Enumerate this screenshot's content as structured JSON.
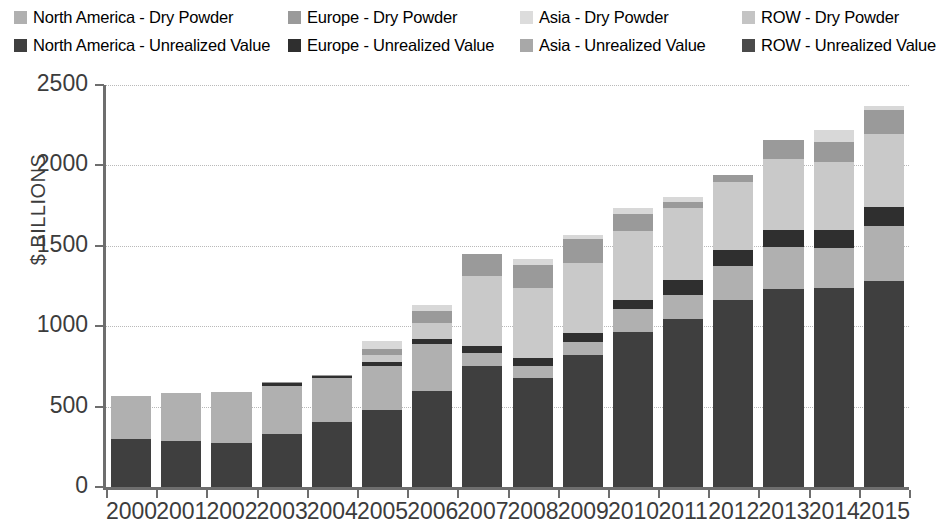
{
  "legend": {
    "rows": [
      [
        {
          "label": "North America - Dry Powder",
          "color": "#b0b0b0",
          "key": "na_dp"
        },
        {
          "label": "Europe - Dry Powder",
          "color": "#9a9a9a",
          "key": "eu_dp"
        },
        {
          "label": "Asia - Dry Powder",
          "color": "#dcdcdc",
          "key": "as_dp"
        },
        {
          "label": "ROW - Dry Powder",
          "color": "#c4c4c4",
          "key": "row_dp"
        }
      ],
      [
        {
          "label": "North America - Unrealized Value",
          "color": "#3f3f3f",
          "key": "na_uv"
        },
        {
          "label": "Europe - Unrealized Value",
          "color": "#2f2f2f",
          "key": "eu_uv"
        },
        {
          "label": "Asia - Unrealized Value",
          "color": "#a8a8a8",
          "key": "as_uv"
        },
        {
          "label": "ROW - Unrealized Value",
          "color": "#4a4a4a",
          "key": "row_uv"
        }
      ]
    ]
  },
  "chart_data": {
    "type": "bar",
    "stacked": true,
    "title": "",
    "xlabel": "",
    "ylabel": "$ BILLIONS",
    "ylim": [
      0,
      2500
    ],
    "yticks": [
      0,
      500,
      1000,
      1500,
      2000,
      2500
    ],
    "grid": true,
    "legend_position": "top",
    "categories": [
      "2000",
      "2001",
      "2002",
      "2003",
      "2004",
      "2005",
      "2006",
      "2007",
      "2008",
      "2009",
      "2010",
      "2011",
      "2012",
      "2013",
      "2014",
      "2015"
    ],
    "series": [
      {
        "name": "North America - Unrealized Value",
        "color": "#3f3f3f",
        "values": [
          300,
          285,
          272,
          330,
          405,
          480,
          600,
          755,
          675,
          820,
          965,
          1045,
          1160,
          1230,
          1235,
          1280
        ]
      },
      {
        "name": "North America - Dry Powder",
        "color": "#b0b0b0",
        "values": [
          265,
          300,
          320,
          300,
          270,
          275,
          290,
          80,
          75,
          80,
          140,
          150,
          215,
          265,
          250,
          345
        ]
      },
      {
        "name": "Europe - Unrealized Value",
        "color": "#2f2f2f",
        "values": [
          0,
          0,
          0,
          20,
          15,
          25,
          30,
          45,
          50,
          55,
          60,
          90,
          100,
          105,
          115,
          115
        ]
      },
      {
        "name": "Europe - Dry Powder",
        "color": "#c9c9c9",
        "values": [
          0,
          0,
          0,
          0,
          0,
          40,
          100,
          430,
          435,
          440,
          430,
          450,
          420,
          440,
          420,
          455
        ]
      },
      {
        "name": "Asia - Unrealized Value",
        "color": "#8d8d8d",
        "values": [
          0,
          0,
          0,
          0,
          0,
          0,
          0,
          0,
          0,
          0,
          0,
          0,
          0,
          0,
          0,
          0
        ]
      },
      {
        "name": "Asia - Dry Powder",
        "color": "#9a9a9a",
        "values": [
          0,
          0,
          0,
          5,
          5,
          40,
          75,
          140,
          145,
          145,
          100,
          40,
          45,
          120,
          125,
          150
        ]
      },
      {
        "name": "ROW - Unrealized Value",
        "color": "#4a4a4a",
        "values": [
          0,
          0,
          0,
          0,
          0,
          0,
          0,
          0,
          0,
          0,
          0,
          0,
          0,
          0,
          0,
          0
        ]
      },
      {
        "name": "ROW - Dry Powder",
        "color": "#d8d8d8",
        "values": [
          0,
          0,
          0,
          0,
          0,
          45,
          35,
          0,
          35,
          30,
          40,
          30,
          0,
          0,
          75,
          25
        ]
      }
    ]
  }
}
